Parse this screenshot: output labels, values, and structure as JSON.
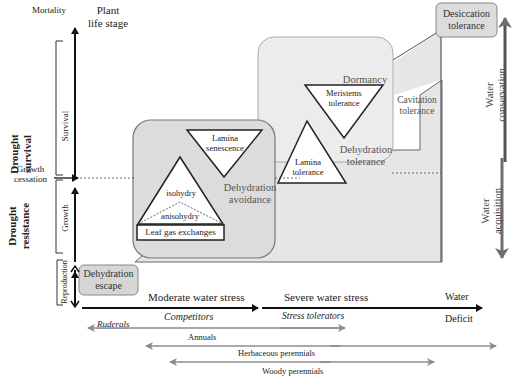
{
  "axis": {
    "plant_life_stage": "Plant life stage",
    "plant_life_stage_line1": "Plant",
    "plant_life_stage_line2": "life stage",
    "mortality": "Mortality",
    "growth_cessation_line1": "Growth",
    "growth_cessation_line2": "cessation",
    "survival": "Survival",
    "growth": "Growth",
    "reproduction": "Reproduction"
  },
  "left_groups": {
    "drought_survival_line1": "Drought",
    "drought_survival_line2": "survival",
    "drought_resistance_line1": "Drought",
    "drought_resistance_line2": "resistance"
  },
  "strategies": {
    "dehydration_escape_line1": "Dehydration",
    "dehydration_escape_line2": "escape",
    "dehydration_avoidance_line1": "Dehydration",
    "dehydration_avoidance_line2": "avoidance",
    "dehydration_tolerance_line1": "Dehydration",
    "dehydration_tolerance_line2": "tolerance",
    "cavitation_tolerance_line1": "Cavitation",
    "cavitation_tolerance_line2": "tolerance",
    "desiccation_tolerance_line1": "Desiccation",
    "desiccation_tolerance_line2": "tolerance",
    "dormancy": "Dormancy"
  },
  "triangles": {
    "lamina_senescence_line1": "Lamina",
    "lamina_senescence_line2": "senescence",
    "isohydry": "isohydry",
    "anisohydry": "anisohydry",
    "leaf_gas_exchanges": "Leaf gas exchanges",
    "meristems_tolerance_line1": "Meristems",
    "meristems_tolerance_line2": "tolerance",
    "lamina_tolerance_line1": "Lamina",
    "lamina_tolerance_line2": "tolerance"
  },
  "stress_axis": {
    "moderate": "Moderate water stress",
    "severe": "Severe water stress",
    "water_deficit_line1": "Water",
    "water_deficit_line2": "Deficit",
    "competitors": "Competitors",
    "stress_tolerators": "Stress tolerators"
  },
  "life_forms": {
    "ruderals": "Ruderals",
    "annuals": "Annuals",
    "herbaceous_perennials": "Herbaceous perennials",
    "woody_perennials": "Woody perennials"
  },
  "water_axis": {
    "conservation_line1": "Water",
    "conservation_line2": "conservation",
    "acquisition_line1": "Water",
    "acquisition_line2": "acquisition"
  },
  "colors": {
    "box_fill": "#d9d9d9",
    "box_light_fill": "#e8e8e8",
    "box_stroke": "#8a8a8a",
    "arrow_dark": "#111111",
    "arrow_gray": "#8c8c8c",
    "water_arrow": "#6e6e6e"
  }
}
